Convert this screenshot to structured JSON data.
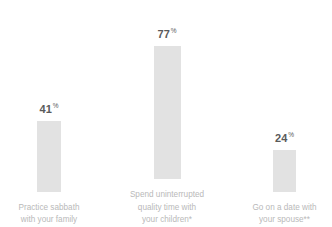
{
  "chart_data": {
    "type": "bar",
    "title": "",
    "subtitle": "",
    "xlabel": "",
    "ylabel": "",
    "ylim": [
      0,
      100
    ],
    "grid": false,
    "legend": null,
    "units": "%",
    "categories": [
      "Practice sabbath with your family",
      "Spend uninterrupted quality time with your children*",
      "Go on a date with your spouse**"
    ],
    "values": [
      41,
      77,
      24
    ],
    "value_labels": [
      "41",
      "77",
      "24"
    ],
    "percent_symbol": "%",
    "bar_color": "#e2e2e2",
    "value_label_color": "#5a5a5a",
    "category_label_color": "#b9b9b9",
    "background_color": "#ffffff",
    "bars": [
      {
        "value": 41,
        "value_label": "41",
        "label_lines": [
          "Practice sabbath",
          "with your family"
        ],
        "annotation": ""
      },
      {
        "value": 77,
        "value_label": "77",
        "label_lines": [
          "Spend uninterrupted",
          "quality time with",
          "your children*"
        ],
        "annotation": "*"
      },
      {
        "value": 24,
        "value_label": "24",
        "label_lines": [
          "Go on a date with",
          "your spouse**"
        ],
        "annotation": "**"
      }
    ]
  }
}
